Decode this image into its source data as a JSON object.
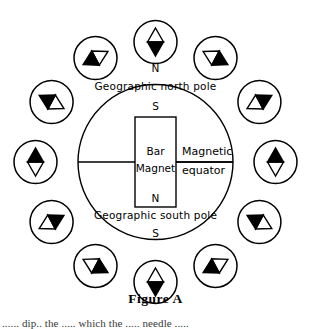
{
  "figure": {
    "caption": "Figure A",
    "earth": {
      "north_tick_label": "N",
      "south_tick_label": "S",
      "north_pole_label": "Geographic north pole",
      "south_pole_label": "Geographic south pole",
      "equator_label_line1": "Magnetic",
      "equator_label_line2": "equator"
    },
    "magnet": {
      "top_pole_label": "S",
      "bottom_pole_label": "N",
      "name_line1": "Bar",
      "name_line2": "Magnet"
    },
    "colors": {
      "ink": "#000000",
      "paper": "#ffffff",
      "needle_north_fill": "#000000",
      "needle_south_fill": "#ffffff"
    },
    "compasses": [
      {
        "id": "compass-12-oclock",
        "clock": "12:00",
        "angle_deg": 0,
        "dip_deg": 0,
        "black_end": "down"
      },
      {
        "id": "compass-1-oclock",
        "clock": "1:00",
        "angle_deg": 30,
        "dip_deg": -62,
        "black_end": "left"
      },
      {
        "id": "compass-2-oclock",
        "clock": "2:00",
        "angle_deg": 60,
        "dip_deg": -118,
        "black_end": "left"
      },
      {
        "id": "compass-3-oclock",
        "clock": "3:00",
        "angle_deg": 90,
        "dip_deg": 180,
        "black_end": "up"
      },
      {
        "id": "compass-4-oclock",
        "clock": "4:00",
        "angle_deg": 120,
        "dip_deg": 118,
        "black_end": "right"
      },
      {
        "id": "compass-5-oclock",
        "clock": "5:00",
        "angle_deg": 150,
        "dip_deg": 62,
        "black_end": "right"
      },
      {
        "id": "compass-6-oclock",
        "clock": "6:00",
        "angle_deg": 180,
        "dip_deg": 0,
        "black_end": "down"
      },
      {
        "id": "compass-7-oclock",
        "clock": "7:00",
        "angle_deg": 210,
        "dip_deg": -62,
        "black_end": "left"
      },
      {
        "id": "compass-8-oclock",
        "clock": "8:00",
        "angle_deg": 240,
        "dip_deg": -118,
        "black_end": "left"
      },
      {
        "id": "compass-9-oclock",
        "clock": "9:00",
        "angle_deg": 270,
        "dip_deg": 180,
        "black_end": "up"
      },
      {
        "id": "compass-10-oclock",
        "clock": "10:00",
        "angle_deg": 300,
        "dip_deg": 118,
        "black_end": "right"
      },
      {
        "id": "compass-11-oclock",
        "clock": "11:00",
        "angle_deg": 330,
        "dip_deg": 62,
        "black_end": "right"
      }
    ]
  },
  "page": {
    "cropped_body_line": "......  dip..  the  .....  which  the  ..... needle  ....."
  }
}
